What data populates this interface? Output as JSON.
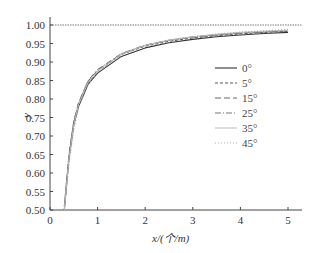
{
  "chart_data": {
    "type": "line",
    "title": "",
    "xlabel": "x/(个/m)",
    "ylabel": "y",
    "xlim": [
      0,
      5.2
    ],
    "ylim": [
      0.5,
      1.02
    ],
    "xticks": [
      "0",
      "1",
      "2",
      "3",
      "4",
      "5"
    ],
    "yticks": [
      "0.50",
      "0.55",
      "0.60",
      "0.65",
      "0.70",
      "0.75",
      "0.80",
      "0.85",
      "0.90",
      "0.95",
      "1.00"
    ],
    "grid": false,
    "reference_line": {
      "y": 1.0,
      "style": "dotted"
    },
    "legend_position": "right-middle",
    "x": [
      0.3,
      0.4,
      0.5,
      0.6,
      0.8,
      1.0,
      1.5,
      2.0,
      2.5,
      3.0,
      3.5,
      4.0,
      4.5,
      5.0
    ],
    "series": [
      {
        "name": "0°",
        "style": "solid",
        "values": [
          0.5,
          0.64,
          0.73,
          0.78,
          0.84,
          0.87,
          0.915,
          0.938,
          0.952,
          0.961,
          0.968,
          0.973,
          0.977,
          0.98
        ]
      },
      {
        "name": "5°",
        "style": "dashed",
        "values": [
          0.5,
          0.645,
          0.735,
          0.785,
          0.845,
          0.875,
          0.92,
          0.943,
          0.956,
          0.965,
          0.971,
          0.976,
          0.98,
          0.983
        ]
      },
      {
        "name": "15°",
        "style": "dash-long",
        "values": [
          0.51,
          0.65,
          0.74,
          0.79,
          0.848,
          0.878,
          0.922,
          0.945,
          0.958,
          0.967,
          0.973,
          0.978,
          0.981,
          0.984
        ]
      },
      {
        "name": "25°",
        "style": "dash-dot",
        "values": [
          0.51,
          0.65,
          0.74,
          0.79,
          0.85,
          0.88,
          0.923,
          0.946,
          0.959,
          0.968,
          0.974,
          0.978,
          0.982,
          0.985
        ]
      },
      {
        "name": "35°",
        "style": "light",
        "values": [
          0.5,
          0.64,
          0.73,
          0.785,
          0.845,
          0.876,
          0.921,
          0.945,
          0.959,
          0.968,
          0.975,
          0.98,
          0.983,
          0.986
        ]
      },
      {
        "name": "45°",
        "style": "dotted",
        "values": [
          0.48,
          0.62,
          0.715,
          0.775,
          0.838,
          0.872,
          0.92,
          0.945,
          0.96,
          0.969,
          0.976,
          0.981,
          0.985,
          0.988
        ]
      }
    ]
  }
}
